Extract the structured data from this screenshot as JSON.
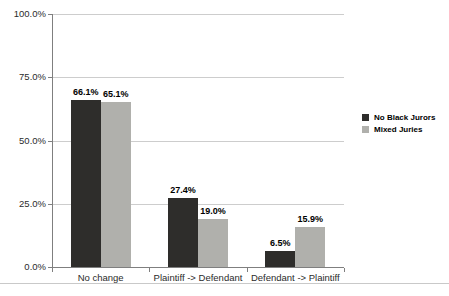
{
  "chart_data": {
    "type": "bar",
    "title": "",
    "categories": [
      "No change",
      "Plaintiff -> Defendant",
      "Defendant -> Plaintiff"
    ],
    "series": [
      {
        "name": "No Black Jurors",
        "color": "#2e2d2b",
        "values": [
          66.1,
          27.4,
          6.5
        ],
        "labels": [
          "66.1%",
          "27.4%",
          "6.5%"
        ]
      },
      {
        "name": "Mixed Juries",
        "color": "#b0b0ac",
        "values": [
          65.1,
          19.0,
          15.9
        ],
        "labels": [
          "65.1%",
          "19.0%",
          "15.9%"
        ]
      }
    ],
    "y_axis": {
      "min": 0,
      "max": 100,
      "ticks": [
        0,
        25,
        50,
        75,
        100
      ],
      "tick_labels": [
        "0.0%",
        "25.0%",
        "50.0%",
        "75.0%",
        "100.0%"
      ]
    },
    "xlabel": "",
    "ylabel": "",
    "grid": true,
    "legend_position": "right"
  },
  "colors": {
    "grid": "#cdcdcd",
    "axis": "#7f7f7f",
    "bottom_rule": "#c9c9c9"
  }
}
